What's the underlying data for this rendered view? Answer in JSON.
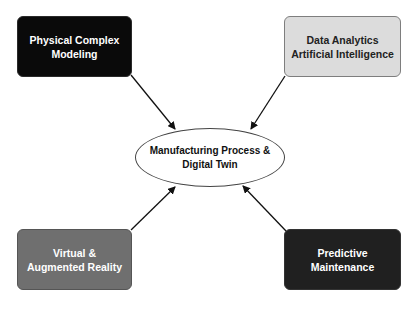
{
  "diagram": {
    "center": {
      "line1": "Manufacturing Process &",
      "line2": "Digital Twin"
    },
    "nodes": [
      {
        "id": "top-left",
        "line1": "Physical Complex",
        "line2": "Modeling",
        "fill": "#0a0a0a",
        "text_color": "#ffffff"
      },
      {
        "id": "top-right",
        "line1": "Data Analytics",
        "line2": "Artificial Intelligence",
        "fill": "#dcdcdc",
        "text_color": "#222222"
      },
      {
        "id": "bottom-left",
        "line1": "Virtual &",
        "line2": "Augmented Reality",
        "fill": "#6f6f6f",
        "text_color": "#ffffff"
      },
      {
        "id": "bottom-right",
        "line1": "Predictive",
        "line2": "Maintenance",
        "fill": "#202020",
        "text_color": "#ffffff"
      }
    ],
    "edges": [
      {
        "from": "top-left",
        "to": "center",
        "arrow": "end"
      },
      {
        "from": "top-right",
        "to": "center",
        "arrow": "end"
      },
      {
        "from": "bottom-left",
        "to": "center",
        "arrow": "end"
      },
      {
        "from": "bottom-right",
        "to": "center",
        "arrow": "end"
      }
    ]
  }
}
